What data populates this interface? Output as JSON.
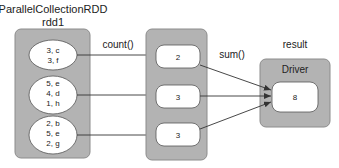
{
  "source": {
    "title": "ParallelCollectionRDD",
    "subtitle": "rdd1",
    "partitions": [
      {
        "lines": [
          "3, c",
          "3, f"
        ]
      },
      {
        "lines": [
          "5, e",
          "4, d",
          "1, h"
        ]
      },
      {
        "lines": [
          "2, b",
          "5, e",
          "2, g"
        ]
      }
    ]
  },
  "transform": {
    "label": "count()",
    "partitions": [
      {
        "value": "2"
      },
      {
        "value": "3"
      },
      {
        "value": "3"
      }
    ]
  },
  "action": {
    "label": "sum()"
  },
  "result": {
    "label": "result",
    "box_title": "Driver",
    "value": "8"
  },
  "colors": {
    "container_fill": "#b3b3b3",
    "container_stroke": "#8c8c8c",
    "node_fill": "#ffffff",
    "edge": "#333333",
    "text": "#222222"
  }
}
